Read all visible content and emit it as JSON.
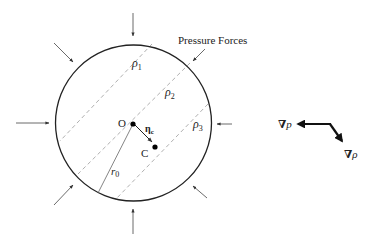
{
  "diagram": {
    "title_label": "Pressure Forces",
    "colors": {
      "stroke": "#222222",
      "dashed": "#b0b0b0",
      "thin": "#555555",
      "background": "#ffffff"
    },
    "parcel": {
      "shape": "circle",
      "center_label": "O",
      "centroid_label": "C",
      "radius_label_base": "r",
      "radius_label_sub": "0",
      "offset_vector_label_base": "η",
      "offset_vector_label_sub": "c"
    },
    "isopycnals": [
      {
        "label_base": "ρ",
        "label_sub": "1"
      },
      {
        "label_base": "ρ",
        "label_sub": "2"
      },
      {
        "label_base": "ρ",
        "label_sub": "3"
      }
    ],
    "pressure_arrows_count": 8,
    "gradients": {
      "pressure_gradient_label": "∇p",
      "density_gradient_label": "∇ρ",
      "pressure_symbol": "∇",
      "pressure_var": "p",
      "density_symbol": "∇",
      "density_var": "ρ"
    }
  }
}
